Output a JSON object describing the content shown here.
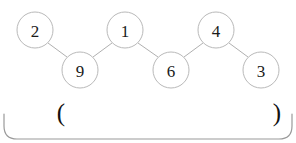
{
  "figure": {
    "title": "",
    "background_color": "#ffffff",
    "node_stroke_color": "#b9b9b9",
    "node_fill_color": "#ffffff",
    "edge_color": "#b0b0b0",
    "label_color": "#1a1a1a",
    "bracket_color": "#9a9a9a"
  },
  "graph": {
    "layout": "zigzag-chain",
    "node_radius": 18,
    "nodes": [
      {
        "id": "n0",
        "label": "2",
        "cx": 35,
        "cy": 30
      },
      {
        "id": "n1",
        "label": "9",
        "cx": 80,
        "cy": 70
      },
      {
        "id": "n2",
        "label": "1",
        "cx": 125,
        "cy": 30
      },
      {
        "id": "n3",
        "label": "6",
        "cx": 171,
        "cy": 70
      },
      {
        "id": "n4",
        "label": "4",
        "cx": 216,
        "cy": 30
      },
      {
        "id": "n5",
        "label": "3",
        "cx": 261,
        "cy": 70
      }
    ],
    "edges": [
      {
        "from": "n0",
        "to": "n1"
      },
      {
        "from": "n1",
        "to": "n2"
      },
      {
        "from": "n2",
        "to": "n3"
      },
      {
        "from": "n3",
        "to": "n4"
      },
      {
        "from": "n4",
        "to": "n5"
      }
    ]
  },
  "annotations": {
    "left_paren": "(",
    "right_paren": ")",
    "left_paren_x": 61,
    "right_paren_x": 277,
    "paren_y": 112
  },
  "bracket": {
    "shape": "rounded-underbracket",
    "left_x": 4,
    "right_x": 292,
    "top_y": 114,
    "bottom_y": 139,
    "corner_radius": 13
  }
}
